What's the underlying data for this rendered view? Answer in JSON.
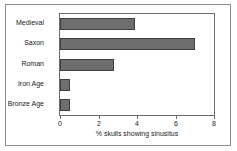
{
  "chart_data": {
    "type": "bar",
    "orientation": "horizontal",
    "title": "",
    "xlabel": "% skulls showing sinusitus",
    "ylabel": "",
    "categories": [
      "Medieval",
      "Saxon",
      "Roman",
      "Iron Age",
      "Bronze Age"
    ],
    "values": [
      3.9,
      7.0,
      2.8,
      0.5,
      0.5
    ],
    "xlim": [
      0,
      8
    ],
    "xticks": [
      0,
      2,
      4,
      6,
      8
    ],
    "xtick_labels": [
      "0",
      "2",
      "4",
      "6",
      "8"
    ],
    "grid": false,
    "legend": false,
    "series": [
      {
        "name": "% skulls showing sinusitus",
        "values": [
          3.9,
          7.0,
          2.8,
          0.5,
          0.5
        ]
      }
    ],
    "colors": {
      "bar_fill": "#6e6e6e",
      "bar_border": "#3f3f3f",
      "axis": "#6b6b6b",
      "outer_border": "#8f8f8f",
      "background": "#ffffff",
      "text": "#1a1a1a"
    }
  }
}
